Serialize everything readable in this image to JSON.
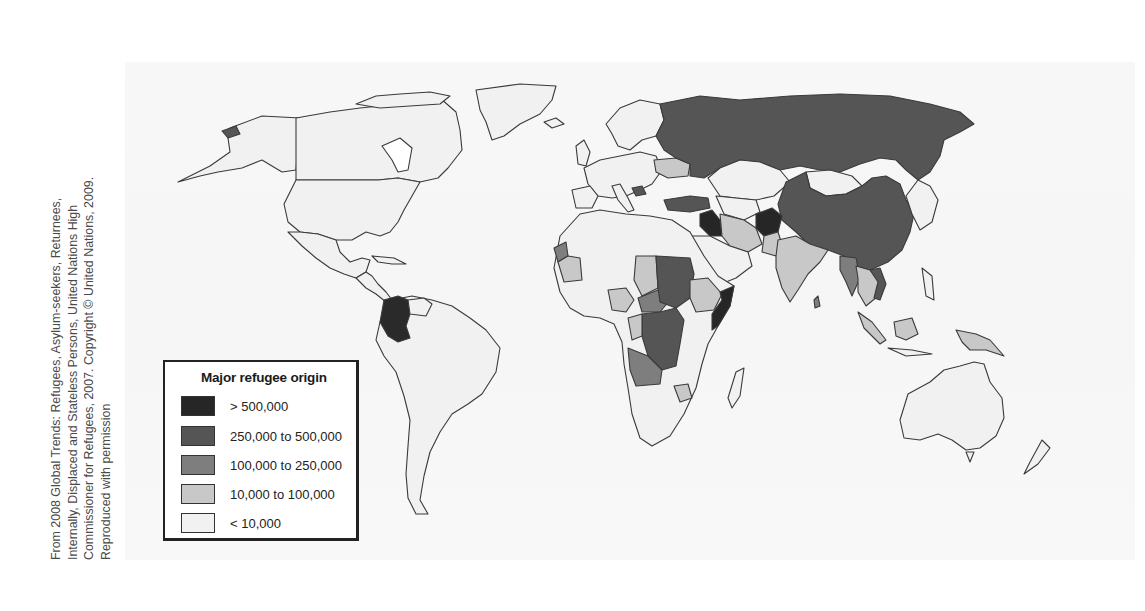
{
  "caption": {
    "lines": [
      "From 2008 Global Trends: Refugees, Asylum-seekers, Returnees,",
      "Internally, Displaced and Stateless Persons, United Nations High",
      "Commissioner for Refugees, 2007. Copyright © United Nations, 2009.",
      "Reproduced with permission"
    ]
  },
  "legend": {
    "title": "Major refugee origin",
    "items": [
      {
        "label": "> 500,000",
        "color": "#262626"
      },
      {
        "label": "250,000 to 500,000",
        "color": "#555555"
      },
      {
        "label": "100,000 to 250,000",
        "color": "#7e7e7e"
      },
      {
        "label": "10,000 to 100,000",
        "color": "#c8c8c8"
      },
      {
        "label": "< 10,000",
        "color": "#f1f1f1"
      }
    ]
  },
  "map": {
    "title": "Major refugee origin",
    "classes": {
      "over_500k": [
        "Colombia",
        "Iraq",
        "Afghanistan",
        "Somalia"
      ],
      "250k_to_500k": [
        "Russia",
        "China",
        "Turkey",
        "Sudan",
        "Democratic Republic of the Congo",
        "Vietnam",
        "Bosnia and Herzegovina"
      ],
      "100k_to_250k": [
        "Angola",
        "Central African Republic",
        "Western Sahara",
        "Myanmar",
        "Eritrea",
        "Burundi"
      ],
      "10k_to_100k": [
        "Ukraine",
        "Iran",
        "India",
        "Pakistan",
        "Sri Lanka",
        "Mauritania",
        "Nigeria",
        "Chad",
        "Ethiopia",
        "Congo",
        "Zimbabwe",
        "Indonesia",
        "Papua New Guinea",
        "Laos",
        "Cambodia",
        "Liberia",
        "Rwanda",
        "Tajikistan"
      ],
      "under_10k": [
        "United States",
        "Canada",
        "Mexico",
        "Brazil",
        "Argentina",
        "Australia",
        "Mongolia",
        "Kazakhstan",
        "Western Europe",
        "Saudi Arabia",
        "Egypt",
        "Libya",
        "Algeria",
        "South Africa",
        "Greenland"
      ]
    }
  }
}
